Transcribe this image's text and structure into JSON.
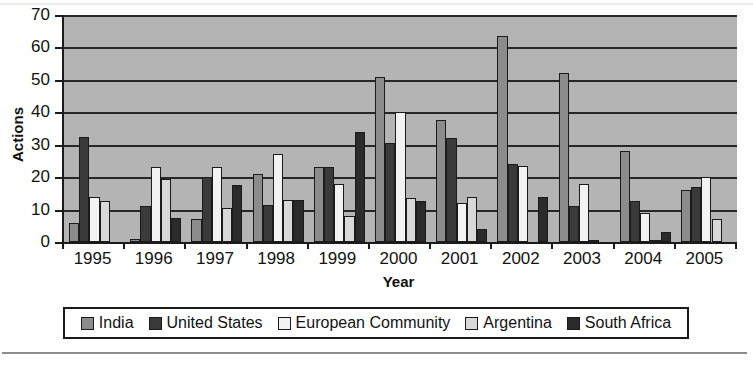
{
  "chart_data": {
    "type": "bar",
    "title": "",
    "xlabel": "Year",
    "ylabel": "Actions",
    "categories": [
      "1995",
      "1996",
      "1997",
      "1998",
      "1999",
      "2000",
      "2001",
      "2002",
      "2003",
      "2004",
      "2005"
    ],
    "ylim": [
      0,
      70
    ],
    "yticks": [
      0,
      10,
      20,
      30,
      40,
      50,
      60,
      70
    ],
    "ytick_labels": [
      "0",
      "10",
      "20",
      "30",
      "40",
      "50",
      "60",
      "70"
    ],
    "grid": true,
    "legend_position": "bottom",
    "plot_background": "#b4b4b4",
    "series": [
      {
        "name": "India",
        "color": "#8c8c8c",
        "values": [
          6,
          1,
          7,
          21,
          23,
          51,
          37.5,
          63.5,
          52,
          28,
          16
        ]
      },
      {
        "name": "United States",
        "color": "#3a3a3a",
        "values": [
          32.5,
          11,
          20,
          11.5,
          23,
          30.5,
          32,
          24,
          11,
          12.5,
          17
        ]
      },
      {
        "name": "European Community",
        "color": "#f2f2f2",
        "values": [
          14,
          23,
          23,
          27,
          18,
          40,
          12,
          23.5,
          18,
          9,
          20
        ]
      },
      {
        "name": "Argentina",
        "color": "#d8d8d8",
        "values": [
          12.5,
          19.5,
          10.5,
          13,
          8,
          13.5,
          14,
          0,
          0.5,
          0.5,
          7
        ]
      },
      {
        "name": "South Africa",
        "color": "#2b2b2b",
        "values": [
          0,
          7.5,
          17.5,
          13,
          34,
          12.5,
          4,
          14,
          0,
          3,
          0
        ]
      }
    ]
  },
  "legend": {
    "items": [
      {
        "label": "India",
        "color": "#8c8c8c"
      },
      {
        "label": "United States",
        "color": "#3a3a3a"
      },
      {
        "label": "European Community",
        "color": "#f2f2f2"
      },
      {
        "label": "Argentina",
        "color": "#d8d8d8"
      },
      {
        "label": "South Africa",
        "color": "#2b2b2b"
      }
    ]
  }
}
